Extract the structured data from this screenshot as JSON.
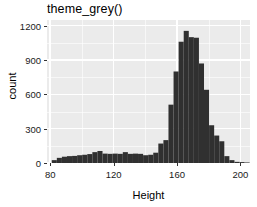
{
  "chart_data": {
    "type": "bar",
    "title": "theme_grey()",
    "xlabel": "Height",
    "ylabel": "count",
    "xlim": [
      78,
      206
    ],
    "ylim": [
      0,
      1250
    ],
    "xticks": [
      80,
      120,
      160,
      200
    ],
    "yticks": [
      0,
      300,
      600,
      900,
      1200
    ],
    "xtick_labels": [
      "80",
      "120",
      "160",
      "200"
    ],
    "ytick_labels": [
      "0",
      "300",
      "600",
      "900",
      "1200"
    ],
    "grid": true,
    "legend": "none",
    "bar_color": "#303030",
    "panel_color": "#EBEBEB",
    "grid_color": "#FFFFFF",
    "binwidth": 3.2,
    "bin_starts": [
      81.0,
      84.2,
      87.4,
      90.6,
      93.8,
      97.0,
      100.2,
      103.4,
      106.6,
      109.8,
      113.0,
      116.2,
      119.4,
      122.6,
      125.8,
      129.0,
      132.2,
      135.4,
      138.6,
      141.8,
      145.0,
      148.2,
      151.4,
      154.6,
      157.8,
      161.0,
      164.2,
      167.4,
      170.6,
      173.8,
      177.0,
      180.2,
      183.4,
      186.6,
      189.8,
      193.0,
      196.2,
      199.4,
      202.6
    ],
    "categories": [
      "81.0",
      "84.2",
      "87.4",
      "90.6",
      "93.8",
      "97.0",
      "100.2",
      "103.4",
      "106.6",
      "109.8",
      "113.0",
      "116.2",
      "119.4",
      "122.6",
      "125.8",
      "129.0",
      "132.2",
      "135.4",
      "138.6",
      "141.8",
      "145.0",
      "148.2",
      "151.4",
      "154.6",
      "157.8",
      "161.0",
      "164.2",
      "167.4",
      "170.6",
      "173.8",
      "177.0",
      "180.2",
      "183.4",
      "186.6",
      "189.8",
      "193.0",
      "196.2",
      "199.4",
      "202.6"
    ],
    "values": [
      25,
      45,
      55,
      60,
      62,
      68,
      72,
      78,
      95,
      105,
      82,
      80,
      82,
      80,
      95,
      80,
      82,
      80,
      68,
      72,
      90,
      170,
      200,
      510,
      800,
      1060,
      1155,
      1100,
      1095,
      870,
      640,
      330,
      240,
      190,
      60,
      25,
      10,
      8,
      5
    ]
  }
}
